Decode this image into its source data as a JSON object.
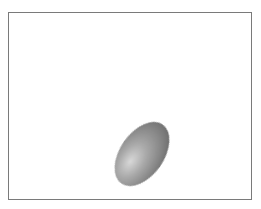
{
  "image": {
    "background": "#ffffff",
    "frame": {
      "border_color": "#7a7a7a"
    },
    "shape": {
      "kind": "ellipse",
      "shading": "3d-gray-gradient",
      "highlight_color": "#d6d6d6",
      "mid_color": "#9a9a9a",
      "shadow_color": "#5e5e5e"
    }
  }
}
